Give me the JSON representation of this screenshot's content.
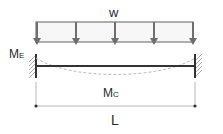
{
  "diagram": {
    "load_label": "w",
    "end_moment_label": "M",
    "end_moment_subscript": "E",
    "center_moment_label": "M",
    "center_moment_subscript": "C",
    "span_label": "L",
    "colors": {
      "beam": "#333333",
      "load": "#7a7a7a",
      "deflection": "#bbbbbb",
      "dimension": "#9a9a9a",
      "text": "#2a2a2a"
    }
  }
}
